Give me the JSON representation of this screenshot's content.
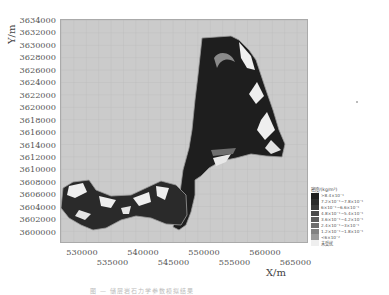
{
  "chart_data": {
    "type": "heatmap",
    "title": "",
    "xlabel": "X/m",
    "ylabel": "Y/m",
    "xlim": [
      527000,
      568000
    ],
    "ylim": [
      3599000,
      3634500
    ],
    "grid": true,
    "legend_position": "right-bottom",
    "x_ticks": [
      "530000",
      "535000",
      "540000",
      "545000",
      "550000",
      "555000",
      "560000",
      "565000"
    ],
    "y_ticks": [
      "3634000",
      "3632000",
      "3630000",
      "3628000",
      "3626000",
      "3624000",
      "3622000",
      "3620000",
      "3618000",
      "3616000",
      "3614000",
      "3612000",
      "3610000",
      "3608000",
      "3606000",
      "3604000",
      "3602000",
      "3600000"
    ],
    "legend": {
      "title": "密度/(kg/m²)",
      "entries": [
        {
          "label": ">8.4×10⁻¹",
          "color": "#1e1e1e"
        },
        {
          "label": "7.2×10⁻¹~7.8×10⁻¹",
          "color": "#2b2b2b"
        },
        {
          "label": "6×10⁻¹~6.6×10⁻¹",
          "color": "#3a3a3a"
        },
        {
          "label": "4.8×10⁻¹~5.4×10⁻¹",
          "color": "#4a4a4a"
        },
        {
          "label": "3.6×10⁻¹~4.2×10⁻¹",
          "color": "#5c5c5c"
        },
        {
          "label": "2.4×10⁻¹~3×10⁻¹",
          "color": "#6e6e6e"
        },
        {
          "label": "1.2×10⁻¹~1.8×10⁻¹",
          "color": "#828282"
        },
        {
          "label": "<6×10⁻²",
          "color": "#9a9a9a"
        },
        {
          "label": "未受扰",
          "color": "#efefef"
        }
      ]
    },
    "regions": [
      {
        "name": "northern-block",
        "description": "large mostly dark (high density) region bounded roughly X 547000-563000, Y 3612000-3632500, with lighter dendritic fringes on east side"
      },
      {
        "name": "southwest-arm",
        "description": "curved strip from X 528500 to 549000 near Y 3600500-3609500, mixed dark and light dendritic pattern"
      }
    ],
    "background_color": "#c9c9c9"
  },
  "axes": {
    "ylabel": "Y/m",
    "xlabel": "X/m"
  },
  "caption": "图 — 储层岩石力学参数模拟结果"
}
